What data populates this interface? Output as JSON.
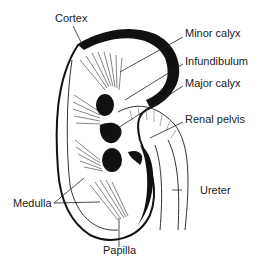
{
  "diagram": {
    "labels": {
      "cortex": "Cortex",
      "minor_calyx": "Minor calyx",
      "infundibulum": "Infundibulum",
      "major_calyx": "Major calyx",
      "renal_pelvis": "Renal pelvis",
      "ureter": "Ureter",
      "medulla": "Medulla",
      "papilla": "Papilla"
    }
  }
}
